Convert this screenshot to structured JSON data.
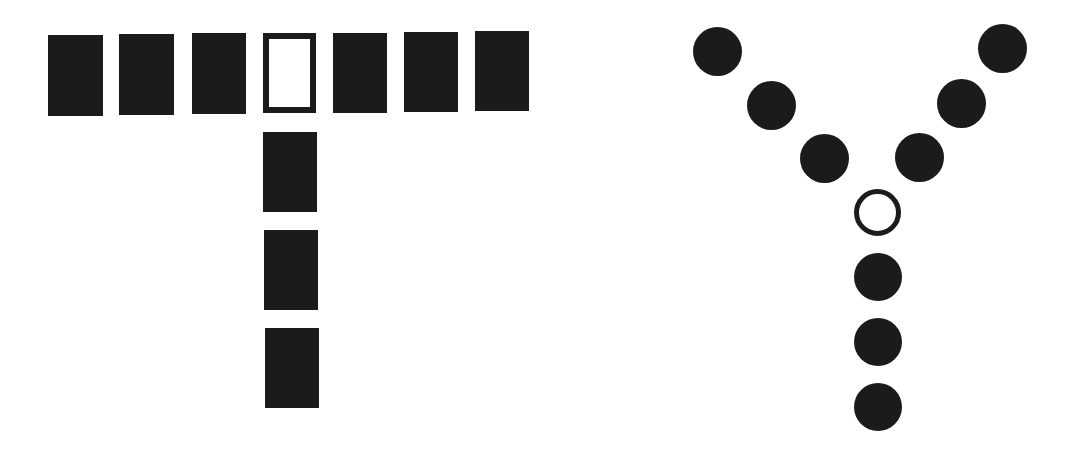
{
  "figure": {
    "fill_color": "#1b1b1b",
    "background_color": "#ffffff",
    "letters": [
      {
        "letter": "T",
        "element_shape": "rectangle",
        "element_count": 10,
        "hollow_index": 3,
        "elements": [
          {
            "x": 48,
            "y": 35,
            "w": 55,
            "h": 81,
            "hollow": false
          },
          {
            "x": 119,
            "y": 34,
            "w": 55,
            "h": 81,
            "hollow": false
          },
          {
            "x": 192,
            "y": 33,
            "w": 54,
            "h": 81,
            "hollow": false
          },
          {
            "x": 263,
            "y": 33,
            "w": 53,
            "h": 80,
            "hollow": true
          },
          {
            "x": 333,
            "y": 33,
            "w": 54,
            "h": 80,
            "hollow": false
          },
          {
            "x": 404,
            "y": 32,
            "w": 54,
            "h": 80,
            "hollow": false
          },
          {
            "x": 475,
            "y": 31,
            "w": 54,
            "h": 80,
            "hollow": false
          },
          {
            "x": 263,
            "y": 132,
            "w": 54,
            "h": 80,
            "hollow": false
          },
          {
            "x": 264,
            "y": 230,
            "w": 54,
            "h": 80,
            "hollow": false
          },
          {
            "x": 265,
            "y": 328,
            "w": 54,
            "h": 80,
            "hollow": false
          }
        ]
      },
      {
        "letter": "Y",
        "element_shape": "circle",
        "element_count": 10,
        "hollow_index": 6,
        "elements": [
          {
            "cx": 717,
            "cy": 51,
            "d": 49,
            "hollow": false
          },
          {
            "cx": 771,
            "cy": 105,
            "d": 49,
            "hollow": false
          },
          {
            "cx": 824,
            "cy": 158,
            "d": 49,
            "hollow": false
          },
          {
            "cx": 1002,
            "cy": 48,
            "d": 49,
            "hollow": false
          },
          {
            "cx": 961,
            "cy": 103,
            "d": 49,
            "hollow": false
          },
          {
            "cx": 919,
            "cy": 157,
            "d": 49,
            "hollow": false
          },
          {
            "cx": 877,
            "cy": 212,
            "d": 47,
            "hollow": true
          },
          {
            "cx": 878,
            "cy": 277,
            "d": 48,
            "hollow": false
          },
          {
            "cx": 878,
            "cy": 342,
            "d": 48,
            "hollow": false
          },
          {
            "cx": 878,
            "cy": 407,
            "d": 48,
            "hollow": false
          }
        ]
      }
    ]
  }
}
